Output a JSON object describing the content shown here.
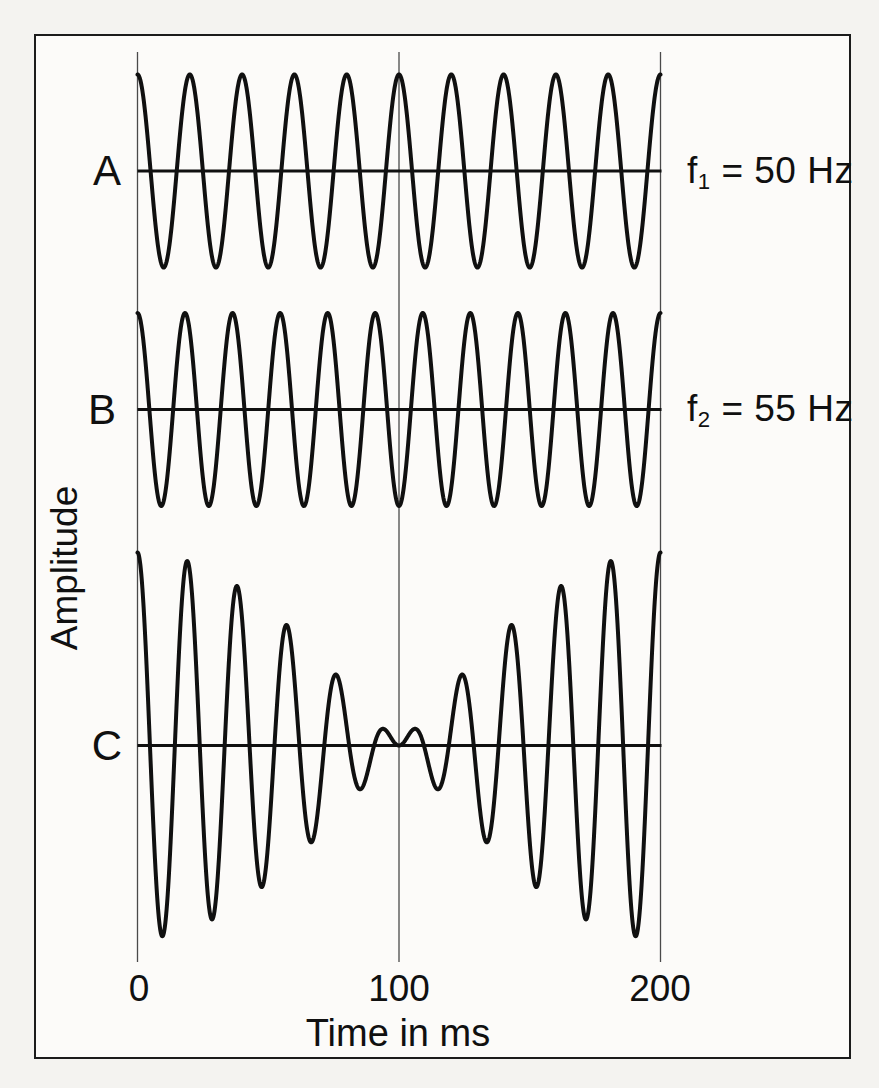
{
  "figure": {
    "background_color": "#fcfbf9",
    "line_color": "#101010",
    "gridline_color": "#4a4a4a"
  },
  "chart_data": {
    "type": "line",
    "title": "",
    "xlabel": "Time in ms",
    "ylabel": "Amplitude",
    "x_ticks": [
      "0",
      "100",
      "200"
    ],
    "x_range_ms": [
      0,
      200
    ],
    "grid": "vertical-lines-at-ticks",
    "legend_position": "none",
    "panels": [
      {
        "label": "A",
        "waveform": "cosine",
        "freqs_hz": [
          50
        ],
        "cycles_shown": 10,
        "rel_amplitude": 1,
        "annotation": {
          "base": "f",
          "sub": "1",
          "rest": " = 50 Hz"
        }
      },
      {
        "label": "B",
        "waveform": "cosine",
        "freqs_hz": [
          55
        ],
        "cycles_shown": 11,
        "rel_amplitude": 1,
        "annotation": {
          "base": "f",
          "sub": "2",
          "rest": " = 55 Hz"
        }
      },
      {
        "label": "C",
        "waveform": "sum-of-cosines",
        "freqs_hz": [
          50,
          55
        ],
        "rel_amplitude": 2,
        "beat_frequency_hz": 5,
        "envelope_null_ms": 100
      }
    ]
  }
}
